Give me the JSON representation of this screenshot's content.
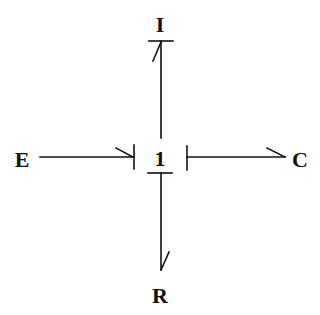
{
  "diagram": {
    "type": "bond-graph",
    "nodes": {
      "center": "1",
      "top": "I",
      "left": "E",
      "right": "C",
      "bottom": "R"
    },
    "bonds": [
      {
        "from": "E",
        "to": "1",
        "causal_stroke_at": "1",
        "half_arrow_at": "1"
      },
      {
        "from": "1",
        "to": "I",
        "causal_stroke_at": "I",
        "half_arrow_at": "I"
      },
      {
        "from": "1",
        "to": "C",
        "causal_stroke_at": "1",
        "half_arrow_at": "C"
      },
      {
        "from": "1",
        "to": "R",
        "causal_stroke_at": "1",
        "half_arrow_at": "R"
      }
    ],
    "colors": {
      "line": "#111111",
      "background": "#ffffff"
    }
  }
}
